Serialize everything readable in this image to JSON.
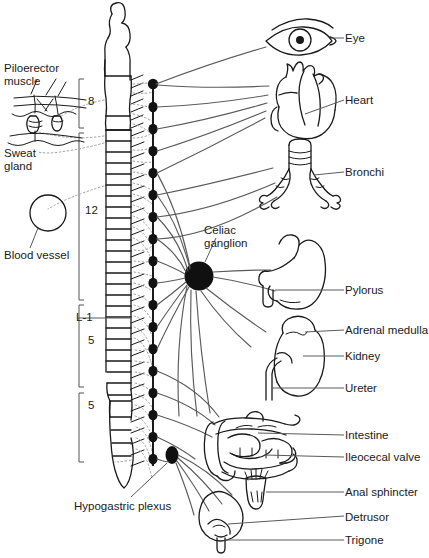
{
  "figure": {
    "colors": {
      "ink": "#1a1a1a",
      "nerve_line": "#555555",
      "gray_dotted": "#9a9a9a",
      "ganglion_fill": "#111111",
      "background": "#ffffff"
    }
  },
  "left_labels": {
    "piloerector_muscle": "Piloerector\nmuscle",
    "sweat_gland": "Sweat\ngland",
    "blood_vessel": "Blood vessel"
  },
  "spinal_segments": [
    {
      "label": "8",
      "name": "thoracic-upper-segment-count"
    },
    {
      "label": "12",
      "name": "thoracic-lower-segment-count"
    },
    {
      "label": "L-1",
      "name": "lumbar-one-marker"
    },
    {
      "label": "5",
      "name": "lumbar-segment-count"
    },
    {
      "label": "5",
      "name": "sacral-segment-count"
    }
  ],
  "center_labels": {
    "celiac_ganglion": "Celiac\nganglion",
    "hypogastric_plexus": "Hypogastric plexus"
  },
  "organ_labels": [
    {
      "name": "label-eye",
      "text": "Eye"
    },
    {
      "name": "label-heart",
      "text": "Heart"
    },
    {
      "name": "label-bronchi",
      "text": "Bronchi"
    },
    {
      "name": "label-pylorus",
      "text": "Pylorus"
    },
    {
      "name": "label-adrenal-medulla",
      "text": "Adrenal medulla"
    },
    {
      "name": "label-kidney",
      "text": "Kidney"
    },
    {
      "name": "label-ureter",
      "text": "Ureter"
    },
    {
      "name": "label-intestine",
      "text": "Intestine"
    },
    {
      "name": "label-ileocecal-valve",
      "text": "Ileocecal valve"
    },
    {
      "name": "label-anal-sphincter",
      "text": "Anal sphincter"
    },
    {
      "name": "label-detrusor",
      "text": "Detrusor"
    },
    {
      "name": "label-trigone",
      "text": "Trigone"
    }
  ],
  "organ_illustrations": [
    {
      "name": "eye-illustration"
    },
    {
      "name": "heart-illustration"
    },
    {
      "name": "bronchi-illustration"
    },
    {
      "name": "stomach-illustration"
    },
    {
      "name": "kidney-illustration"
    },
    {
      "name": "intestine-illustration"
    },
    {
      "name": "anal-sphincter-illustration"
    },
    {
      "name": "bladder-illustration"
    },
    {
      "name": "skin-section-illustration"
    },
    {
      "name": "blood-vessel-illustration"
    },
    {
      "name": "spinal-cord-illustration"
    },
    {
      "name": "sympathetic-chain-illustration"
    }
  ]
}
